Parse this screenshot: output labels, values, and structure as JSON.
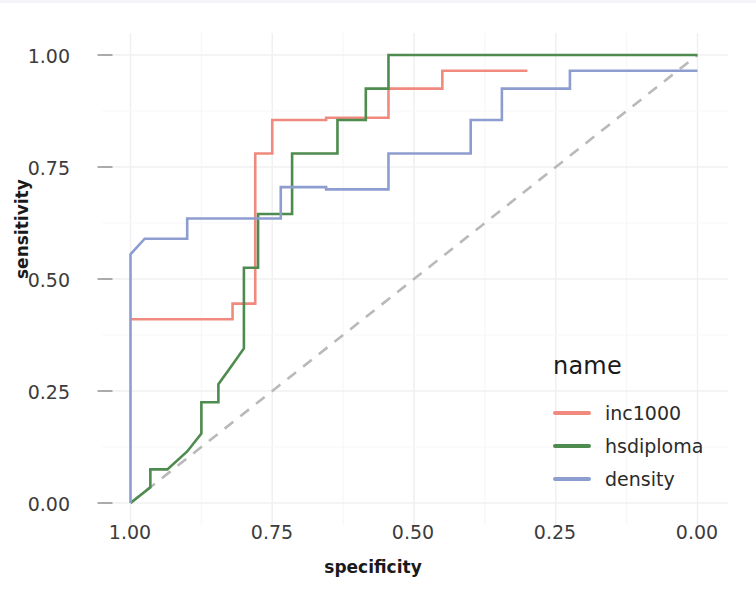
{
  "chart_data": {
    "type": "line",
    "title": "",
    "subtitle": "",
    "xlabel": "specificity",
    "ylabel": "sensitivity",
    "xlim": [
      1.0,
      0.0
    ],
    "ylim": [
      0.0,
      1.0
    ],
    "x_reversed": true,
    "grid": true,
    "legend_position": "right",
    "legend_title": "name",
    "xticks": [
      "1.00",
      "0.75",
      "0.50",
      "0.25",
      "0.00"
    ],
    "xtick_values": [
      1.0,
      0.75,
      0.5,
      0.25,
      0.0
    ],
    "yticks": [
      "0.00",
      "0.25",
      "0.50",
      "0.75",
      "1.00"
    ],
    "ytick_values": [
      0.0,
      0.25,
      0.5,
      0.75,
      1.0
    ],
    "reference_line": {
      "name": "chance-diagonal",
      "style": "dashed",
      "color": "#b9b9b9",
      "points": [
        [
          1.0,
          0.0
        ],
        [
          0.0,
          1.0
        ]
      ]
    },
    "series": [
      {
        "name": "inc1000",
        "color": "#F08A7E",
        "points": [
          [
            1.0,
            0.41
          ],
          [
            0.82,
            0.41
          ],
          [
            0.82,
            0.445
          ],
          [
            0.78,
            0.445
          ],
          [
            0.78,
            0.78
          ],
          [
            0.75,
            0.78
          ],
          [
            0.75,
            0.855
          ],
          [
            0.655,
            0.855
          ],
          [
            0.655,
            0.86
          ],
          [
            0.545,
            0.86
          ],
          [
            0.545,
            0.925
          ],
          [
            0.45,
            0.925
          ],
          [
            0.45,
            0.965
          ],
          [
            0.3,
            0.965
          ]
        ]
      },
      {
        "name": "hsdiploma",
        "color": "#4E8B4E",
        "points": [
          [
            1.0,
            0.0
          ],
          [
            0.965,
            0.035
          ],
          [
            0.965,
            0.075
          ],
          [
            0.935,
            0.075
          ],
          [
            0.9,
            0.115
          ],
          [
            0.875,
            0.155
          ],
          [
            0.875,
            0.225
          ],
          [
            0.845,
            0.225
          ],
          [
            0.845,
            0.265
          ],
          [
            0.825,
            0.3
          ],
          [
            0.8,
            0.345
          ],
          [
            0.8,
            0.525
          ],
          [
            0.775,
            0.525
          ],
          [
            0.775,
            0.645
          ],
          [
            0.715,
            0.645
          ],
          [
            0.715,
            0.78
          ],
          [
            0.635,
            0.78
          ],
          [
            0.635,
            0.855
          ],
          [
            0.585,
            0.855
          ],
          [
            0.585,
            0.925
          ],
          [
            0.545,
            0.925
          ],
          [
            0.545,
            1.0
          ],
          [
            0.0,
            1.0
          ]
        ]
      },
      {
        "name": "density",
        "color": "#8E9DD0",
        "points": [
          [
            1.0,
            0.0
          ],
          [
            1.0,
            0.555
          ],
          [
            0.975,
            0.59
          ],
          [
            0.9,
            0.59
          ],
          [
            0.9,
            0.635
          ],
          [
            0.735,
            0.635
          ],
          [
            0.735,
            0.705
          ],
          [
            0.655,
            0.705
          ],
          [
            0.655,
            0.7
          ],
          [
            0.545,
            0.7
          ],
          [
            0.545,
            0.78
          ],
          [
            0.4,
            0.78
          ],
          [
            0.4,
            0.855
          ],
          [
            0.345,
            0.855
          ],
          [
            0.345,
            0.925
          ],
          [
            0.225,
            0.925
          ],
          [
            0.225,
            0.965
          ],
          [
            0.0,
            0.965
          ]
        ]
      }
    ]
  },
  "legend": {
    "title": "name",
    "entries": [
      {
        "label": "inc1000",
        "color": "#F08A7E"
      },
      {
        "label": "hsdiploma",
        "color": "#4E8B4E"
      },
      {
        "label": "density",
        "color": "#8E9DD0"
      }
    ]
  },
  "axes": {
    "x_title": "specificity",
    "y_title": "sensitivity",
    "x_tick_labels": [
      "1.00",
      "0.75",
      "0.50",
      "0.25",
      "0.00"
    ],
    "y_tick_labels": [
      "1.00",
      "0.75",
      "0.50",
      "0.25",
      "0.00"
    ]
  },
  "caption": {
    "text": ""
  },
  "colors": {
    "grid": "#f0f0f2",
    "background": "#ffffff",
    "text": "#2b2b2b",
    "reference": "#b9b9b9"
  }
}
